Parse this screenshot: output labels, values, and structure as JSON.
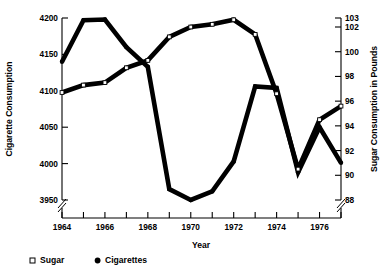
{
  "chart_data": {
    "type": "line",
    "title": "",
    "xlabel": "Year",
    "ylabel": "Cigarette Consumption",
    "y2label": "Sugar Consumption in Pounds",
    "grid": false,
    "legend_position": "bottom-left",
    "x": [
      1964,
      1965,
      1966,
      1967,
      1968,
      1969,
      1970,
      1971,
      1972,
      1973,
      1974,
      1975,
      1976,
      1977
    ],
    "xlim": [
      1964,
      1977
    ],
    "xticks": [
      1964,
      1965,
      1966,
      1967,
      1968,
      1969,
      1970,
      1971,
      1972,
      1973,
      1974,
      1975,
      1976,
      1977
    ],
    "xticklabels": [
      "1964",
      "",
      "1966",
      "",
      "1968",
      "",
      "1970",
      "",
      "1972",
      "",
      "1974",
      "",
      "1976",
      ""
    ],
    "ylim": [
      3950,
      4200
    ],
    "yticks": [
      3950,
      4000,
      4050,
      4100,
      4150,
      4200
    ],
    "yticklabels": [
      "3950",
      "4000",
      "4050",
      "4100",
      "4150",
      "4200"
    ],
    "y_axis_break": true,
    "y2lim": [
      88,
      103
    ],
    "y2ticks": [
      88,
      90,
      92,
      94,
      96,
      98,
      100,
      102,
      103
    ],
    "y2ticklabels": [
      "88",
      "90",
      "92",
      "94",
      "96",
      "98",
      "100",
      "102",
      "103"
    ],
    "y2_axis_break": true,
    "series": [
      {
        "name": "Cigarettes",
        "axis": "left",
        "marker": "filled-circle",
        "color": "#000000",
        "values": [
          4140,
          4197,
          4198,
          4160,
          4133,
          3965,
          3950,
          3962,
          4003,
          4106,
          4104,
          3988,
          4050,
          4001
        ]
      },
      {
        "name": "Sugar",
        "axis": "right",
        "marker": "open-square",
        "color": "#000000",
        "values": [
          96.7,
          97.3,
          97.5,
          98.7,
          99.3,
          101.2,
          102.0,
          102.3,
          102.8,
          101.4,
          96.6,
          90.5,
          94.5,
          95.6
        ]
      }
    ]
  },
  "legend": {
    "items": [
      {
        "marker": "open-square",
        "label": "Sugar"
      },
      {
        "marker": "filled-circle",
        "label": "Cigarettes"
      }
    ]
  }
}
